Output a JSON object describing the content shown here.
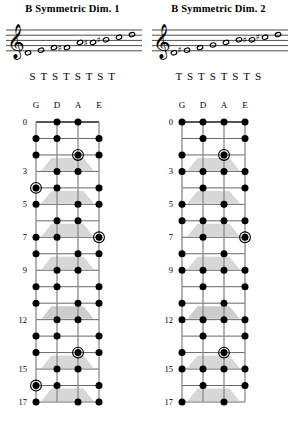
{
  "page": {
    "width": 291,
    "height": 426,
    "background": "#ffffff",
    "ink": "#000000",
    "inlay_color": "#c9c9c9",
    "string_color": "#8a8a8a",
    "fret_color": "#555555"
  },
  "fretboard_common": {
    "strings": [
      "G",
      "D",
      "A",
      "E"
    ],
    "fret_count": 17,
    "labeled_frets": [
      0,
      3,
      5,
      7,
      9,
      12,
      15,
      17
    ],
    "inlay_frets": [
      3,
      5,
      7,
      9,
      12,
      15,
      17
    ],
    "double_inlay_frets": [
      12
    ],
    "root_marker": "circled-dot",
    "tone_marker": "filled-dot"
  },
  "diagrams": [
    {
      "id": "b-symmetric-dim-1",
      "title": "B Symmetric Dim. 1",
      "intervals": [
        "S",
        "T",
        "S",
        "T",
        "S",
        "T",
        "S",
        "T"
      ],
      "interval_text": "S T S T S T S T",
      "staff": {
        "clef": "treble",
        "notes": [
          {
            "step": "B",
            "accidental": "natural",
            "staff_pos": 0
          },
          {
            "step": "C",
            "accidental": "natural",
            "staff_pos": 1
          },
          {
            "step": "D",
            "accidental": "natural",
            "staff_pos": 2
          },
          {
            "step": "D#",
            "accidental": "sharp",
            "staff_pos": 2
          },
          {
            "step": "F",
            "accidental": "natural",
            "staff_pos": 4
          },
          {
            "step": "F#",
            "accidental": "sharp",
            "staff_pos": 4
          },
          {
            "step": "G#",
            "accidental": "sharp",
            "staff_pos": 5
          },
          {
            "step": "A",
            "accidental": "natural",
            "staff_pos": 6
          },
          {
            "step": "B",
            "accidental": "natural",
            "staff_pos": 7
          }
        ]
      },
      "notes_by_string": {
        "G": [
          1,
          2,
          4,
          5,
          7,
          8,
          10,
          11,
          13,
          14,
          16,
          17
        ],
        "D": [
          0,
          1,
          3,
          4,
          6,
          7,
          9,
          10,
          12,
          13,
          15,
          16
        ],
        "A": [
          0,
          2,
          3,
          5,
          6,
          8,
          9,
          11,
          12,
          14,
          15,
          17
        ],
        "E": [
          1,
          2,
          4,
          5,
          7,
          8,
          10,
          11,
          13,
          14,
          16,
          17
        ]
      },
      "roots_by_string": {
        "G": [
          4,
          16
        ],
        "D": [],
        "A": [
          2,
          14
        ],
        "E": [
          7
        ]
      }
    },
    {
      "id": "b-symmetric-dim-2",
      "title": "B Symmetric Dim. 2",
      "intervals": [
        "T",
        "S",
        "T",
        "S",
        "T",
        "S",
        "T",
        "S"
      ],
      "interval_text": "T S T S T S T S",
      "staff": {
        "clef": "treble",
        "notes": [
          {
            "step": "B",
            "accidental": "natural",
            "staff_pos": 0
          },
          {
            "step": "C#",
            "accidental": "sharp",
            "staff_pos": 1
          },
          {
            "step": "D",
            "accidental": "natural",
            "staff_pos": 2
          },
          {
            "step": "E",
            "accidental": "natural",
            "staff_pos": 3
          },
          {
            "step": "F",
            "accidental": "natural",
            "staff_pos": 4
          },
          {
            "step": "G",
            "accidental": "natural",
            "staff_pos": 5
          },
          {
            "step": "G#",
            "accidental": "sharp",
            "staff_pos": 5
          },
          {
            "step": "A#",
            "accidental": "sharp",
            "staff_pos": 6
          },
          {
            "step": "B",
            "accidental": "natural",
            "staff_pos": 7
          }
        ]
      },
      "notes_by_string": {
        "G": [
          0,
          2,
          3,
          5,
          6,
          8,
          9,
          11,
          12,
          14,
          15,
          17
        ],
        "D": [
          0,
          1,
          3,
          4,
          6,
          7,
          9,
          10,
          12,
          13,
          15,
          16
        ],
        "A": [
          0,
          2,
          3,
          5,
          6,
          8,
          9,
          11,
          12,
          14,
          15,
          17
        ],
        "E": [
          0,
          1,
          3,
          4,
          6,
          7,
          9,
          10,
          12,
          13,
          15,
          16
        ]
      },
      "roots_by_string": {
        "G": [
          4,
          16
        ],
        "D": [],
        "A": [
          2,
          14
        ],
        "E": [
          7
        ]
      }
    }
  ]
}
